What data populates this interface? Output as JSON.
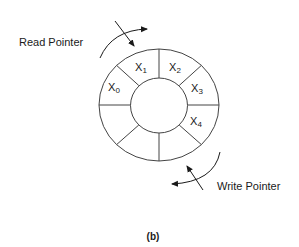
{
  "diagram": {
    "type": "circular-buffer",
    "caption": "(b)",
    "ring": {
      "segments": 8,
      "stroke_color": "#444444",
      "cells": [
        {
          "id": "x0",
          "base": "X",
          "sub": "0"
        },
        {
          "id": "x1",
          "base": "X",
          "sub": "1"
        },
        {
          "id": "x2",
          "base": "X",
          "sub": "2"
        },
        {
          "id": "x3",
          "base": "X",
          "sub": "3"
        },
        {
          "id": "x4",
          "base": "X",
          "sub": "4"
        }
      ]
    },
    "pointers": {
      "read": {
        "label": "Read Pointer"
      },
      "write": {
        "label": "Write Pointer"
      }
    }
  }
}
